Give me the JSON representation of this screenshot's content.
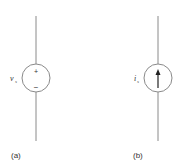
{
  "figure": {
    "panels": [
      {
        "id": "a",
        "caption": "(a)",
        "type": "independent-voltage-source",
        "variable": "v",
        "subscript": "s",
        "plus_sign": "+",
        "minus_sign": "−"
      },
      {
        "id": "b",
        "caption": "(b)",
        "type": "independent-current-source",
        "variable": "i",
        "subscript": "s",
        "arrow_direction": "up"
      }
    ],
    "colors": {
      "stroke": "#8a8a8a",
      "text": "#333333",
      "arrow": "#222222",
      "background": "#ffffff"
    }
  }
}
